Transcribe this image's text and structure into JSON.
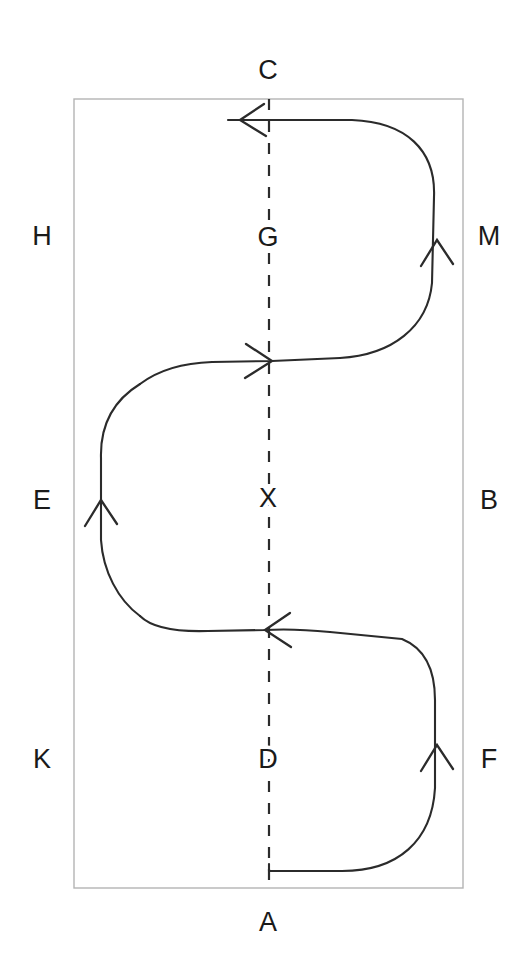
{
  "figure": {
    "background_color": "#ffffff",
    "stroke_color": "#2b2b2b",
    "frame_color": "#b4b4b4",
    "label_color": "#1a1a1a"
  },
  "frame": {
    "x": 74,
    "y": 99,
    "width": 389,
    "height": 789
  },
  "centerline": {
    "label": "dashed-vertical-axis",
    "x": 269,
    "y_top": 99,
    "y_bottom": 888,
    "dash_pattern": "11 11"
  },
  "labels": {
    "outside": [
      {
        "id": "C",
        "text": "C",
        "x": 268,
        "y": 70,
        "position": "top"
      },
      {
        "id": "A",
        "text": "A",
        "x": 268,
        "y": 922,
        "position": "bottom"
      },
      {
        "id": "H",
        "text": "H",
        "x": 42,
        "y": 236,
        "position": "left-upper"
      },
      {
        "id": "E",
        "text": "E",
        "x": 42,
        "y": 500,
        "position": "left-middle"
      },
      {
        "id": "K",
        "text": "K",
        "x": 42,
        "y": 759,
        "position": "left-lower"
      },
      {
        "id": "M",
        "text": "M",
        "x": 489,
        "y": 236,
        "position": "right-upper"
      },
      {
        "id": "B",
        "text": "B",
        "x": 489,
        "y": 500,
        "position": "right-middle"
      },
      {
        "id": "F",
        "text": "F",
        "x": 489,
        "y": 759,
        "position": "right-lower"
      }
    ],
    "on_axis": [
      {
        "id": "G",
        "text": "G",
        "x": 268,
        "y": 237
      },
      {
        "id": "X",
        "text": "X",
        "x": 268,
        "y": 498
      },
      {
        "id": "D",
        "text": "D",
        "x": 268,
        "y": 759
      }
    ]
  },
  "flow": {
    "name": "serpentine-path",
    "direction": "upward-serpentine",
    "start": {
      "x": 269,
      "y": 871
    },
    "end": {
      "x": 228,
      "y": 120
    },
    "path_d": "M 269 871 L 269 866 L 269 871 L 340 871 C 392 871 425 845 430 795 L 430 700 C 430 660 418 642 390 634 L 310 631 C 280 629 255 627 228 627 L 190 627 C 140 627 106 600 102 552 L 102 470 C 102 420 134 392 186 388 L 250 362 L 330 361 C 385 360 425 332 430 285 L 430 195 C 430 150 400 123 350 120 L 228 120"
  },
  "arrows": [
    {
      "id": "arrow-top-left",
      "x": 240,
      "y": 120,
      "direction": "left",
      "label": "arrow pointing left at top"
    },
    {
      "id": "arrow-right-upper-up",
      "x": 437,
      "y": 240,
      "direction": "up",
      "label": "arrow pointing up on upper right"
    },
    {
      "id": "arrow-mid-right",
      "x": 272,
      "y": 361,
      "direction": "right",
      "label": "arrow pointing right at mid upper axis"
    },
    {
      "id": "arrow-left-up",
      "x": 101,
      "y": 500,
      "direction": "up",
      "label": "arrow pointing up on left side"
    },
    {
      "id": "arrow-mid-left",
      "x": 265,
      "y": 630,
      "direction": "left",
      "label": "arrow pointing left at mid lower axis"
    },
    {
      "id": "arrow-right-lower-up",
      "x": 437,
      "y": 745,
      "direction": "up",
      "label": "arrow pointing up on lower right"
    }
  ]
}
